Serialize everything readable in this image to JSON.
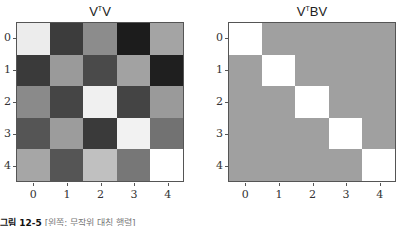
{
  "chart_data": [
    {
      "type": "heatmap",
      "title": "VᵀV",
      "title_base": "V",
      "title_sup": "T",
      "title_rest": "V",
      "xlabel": "",
      "ylabel": "",
      "x_ticks": [
        "0",
        "1",
        "2",
        "3",
        "4"
      ],
      "y_ticks": [
        "0",
        "1",
        "2",
        "3",
        "4"
      ],
      "colormap": "gray",
      "values": [
        [
          0.95,
          0.25,
          0.55,
          0.1,
          0.65
        ],
        [
          0.25,
          0.6,
          0.3,
          0.62,
          0.12
        ],
        [
          0.55,
          0.3,
          0.92,
          0.28,
          0.6
        ],
        [
          0.35,
          0.6,
          0.25,
          0.95,
          0.45
        ],
        [
          0.65,
          0.35,
          0.75,
          0.45,
          1.0
        ]
      ],
      "colors": [
        [
          "#ececec",
          "#3c3c3c",
          "#8c8c8c",
          "#1c1c1c",
          "#a4a4a4"
        ],
        [
          "#3a3a3a",
          "#9a9a9a",
          "#4a4a4a",
          "#a2a2a2",
          "#1f1f1f"
        ],
        [
          "#8a8a8a",
          "#454545",
          "#f0f0f0",
          "#444444",
          "#9a9a9a"
        ],
        [
          "#555555",
          "#9c9c9c",
          "#3a3a3a",
          "#f2f2f2",
          "#727272"
        ],
        [
          "#a6a6a6",
          "#555555",
          "#c0c0c0",
          "#777777",
          "#ffffff"
        ]
      ]
    },
    {
      "type": "heatmap",
      "title": "VᵀBV",
      "title_base": "V",
      "title_sup": "T",
      "title_rest": "BV",
      "xlabel": "",
      "ylabel": "",
      "x_ticks": [
        "0",
        "1",
        "2",
        "3",
        "4"
      ],
      "y_ticks": [
        "0",
        "1",
        "2",
        "3",
        "4"
      ],
      "colormap": "gray",
      "values": [
        [
          1,
          0,
          0,
          0,
          0
        ],
        [
          0,
          1,
          0,
          0,
          0
        ],
        [
          0,
          0,
          1,
          0,
          0
        ],
        [
          0,
          0,
          0,
          1,
          0
        ],
        [
          0,
          0,
          0,
          0,
          1
        ]
      ],
      "colors": [
        [
          "#ffffff",
          "#a0a0a0",
          "#a0a0a0",
          "#a0a0a0",
          "#a0a0a0"
        ],
        [
          "#a0a0a0",
          "#ffffff",
          "#a0a0a0",
          "#a0a0a0",
          "#a0a0a0"
        ],
        [
          "#a0a0a0",
          "#a0a0a0",
          "#ffffff",
          "#a0a0a0",
          "#a0a0a0"
        ],
        [
          "#a0a0a0",
          "#a0a0a0",
          "#a0a0a0",
          "#ffffff",
          "#a0a0a0"
        ],
        [
          "#a0a0a0",
          "#a0a0a0",
          "#a0a0a0",
          "#a0a0a0",
          "#ffffff"
        ]
      ]
    }
  ],
  "caption": {
    "label": "그림 12-5",
    "text": "[왼쪽: 무작위 대칭 행렬]"
  }
}
